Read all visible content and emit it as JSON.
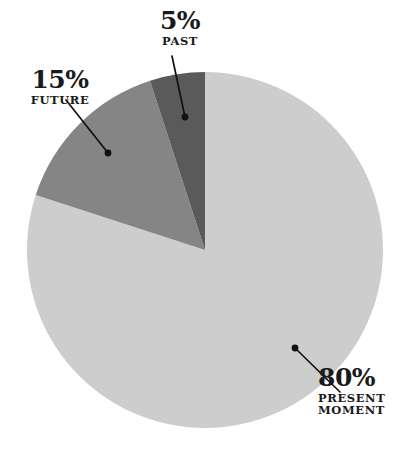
{
  "chart_data": {
    "type": "pie",
    "title": "",
    "subtitle": "",
    "xlabel": "",
    "ylabel": "",
    "legend_position": "callout-labels",
    "grid": false,
    "total": 100,
    "unit": "%",
    "start_angle_deg": 0,
    "direction": "clockwise-from-top-for-largest",
    "categories": [
      "PAST",
      "FUTURE",
      "PRESENT MOMENT"
    ],
    "values": [
      5,
      15,
      80
    ],
    "slices": [
      {
        "id": "past",
        "label": "PAST",
        "label_lines": [
          "PAST"
        ],
        "value": 5,
        "value_text": "5%",
        "color": "#5a5a5a",
        "callout": {
          "dot_x": 185,
          "dot_y": 117,
          "line_end_x": 172,
          "line_end_y": 56
        }
      },
      {
        "id": "future",
        "label": "FUTURE",
        "label_lines": [
          "FUTURE"
        ],
        "value": 15,
        "value_text": "15%",
        "color": "#858585",
        "callout": {
          "dot_x": 108,
          "dot_y": 153,
          "line_end_x": 66,
          "line_end_y": 100
        }
      },
      {
        "id": "present-moment",
        "label": "PRESENT MOMENT",
        "label_lines": [
          "PRESENT",
          "MOMENT"
        ],
        "value": 80,
        "value_text": "80%",
        "color": "#cdcdcd",
        "callout": {
          "dot_x": 295,
          "dot_y": 348,
          "line_end_x": 340,
          "line_end_y": 392
        }
      }
    ],
    "geometry": {
      "center_x": 205,
      "center_y": 250,
      "radius": 178
    },
    "colors": {
      "background": "#ffffff",
      "text": "#1a1a1a",
      "callout_line": "#111111"
    }
  }
}
